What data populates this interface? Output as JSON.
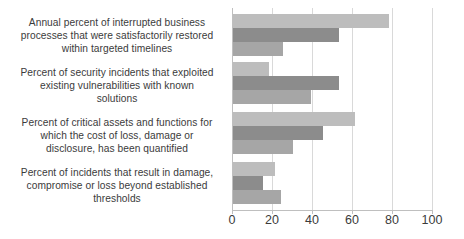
{
  "chart_data": {
    "type": "bar",
    "orientation": "horizontal",
    "title": "",
    "xlabel": "",
    "ylabel": "",
    "xlim": [
      0,
      100
    ],
    "xticks": [
      0,
      20,
      40,
      60,
      80,
      100
    ],
    "grid": true,
    "legend": "none",
    "categories": [
      "Annual percent of interrupted business processes that were satisfactorily restored within targeted timelines",
      "Percent of security incidents that exploited existing vulnerabilities with known solutions",
      "Percent of critical assets and functions for which the cost of loss, damage or disclosure, has been quantified",
      "Percent of incidents that result in damage, compromise or loss beyond established thresholds"
    ],
    "series": [
      {
        "name": "Series 1",
        "color": "#bdbdbd",
        "values": [
          78,
          18,
          61,
          21
        ]
      },
      {
        "name": "Series 2",
        "color": "#8c8c8c",
        "values": [
          53,
          53,
          45,
          15
        ]
      },
      {
        "name": "Series 3",
        "color": "#a6a6a6",
        "values": [
          25,
          39,
          30,
          24
        ]
      }
    ]
  },
  "axis": {
    "tick_labels": [
      "0",
      "20",
      "40",
      "60",
      "80",
      "100"
    ]
  },
  "category_lines": [
    [
      "Annual percent of interrupted business",
      "processes that were satisfactorily restored",
      "within targeted timelines"
    ],
    [
      "Percent of security incidents that exploited",
      "existing vulnerabilities with known",
      "solutions"
    ],
    [
      "Percent of critical assets and functions for",
      "which the cost of loss, damage or",
      "disclosure, has been quantified"
    ],
    [
      "Percent of incidents that result in damage,",
      "compromise or loss beyond established",
      "thresholds"
    ]
  ]
}
